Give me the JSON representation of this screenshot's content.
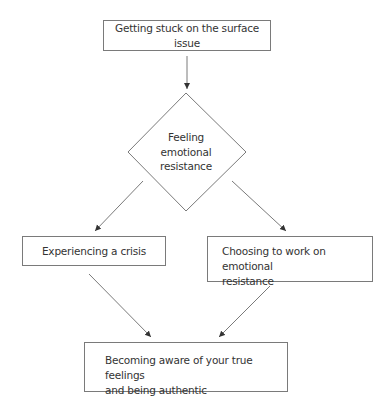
{
  "diagram": {
    "type": "flowchart",
    "colors": {
      "stroke": "#7a7a7a",
      "text": "#333333",
      "background": "#ffffff"
    },
    "nodes": {
      "start": {
        "shape": "rectangle",
        "label": "Getting stuck on the surface issue"
      },
      "decision": {
        "shape": "diamond",
        "lines": [
          "Feeling",
          "emotional",
          "resistance"
        ]
      },
      "left": {
        "shape": "rectangle",
        "label": "Experiencing a crisis"
      },
      "right": {
        "shape": "rectangle",
        "lines": [
          "Choosing to work on emotional",
          "resistance"
        ]
      },
      "end": {
        "shape": "rectangle",
        "lines": [
          "Becoming aware of your true feelings",
          "and being authentic"
        ]
      }
    },
    "edges": [
      {
        "from": "start",
        "to": "decision"
      },
      {
        "from": "decision",
        "to": "left"
      },
      {
        "from": "decision",
        "to": "right"
      },
      {
        "from": "left",
        "to": "end"
      },
      {
        "from": "right",
        "to": "end"
      }
    ]
  }
}
